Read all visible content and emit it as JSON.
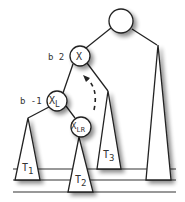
{
  "diagram": {
    "colors": {
      "stroke": "#222222",
      "fill": "#ffffff",
      "text": "#333333",
      "shadow": "#999999"
    },
    "nodes": [
      {
        "id": "root",
        "label": "",
        "cx": 121,
        "cy": 21,
        "r": 12
      },
      {
        "id": "x",
        "label": "X",
        "sub": "",
        "cx": 80,
        "cy": 56,
        "r": 10,
        "balance": "b 2"
      },
      {
        "id": "xl",
        "label": "X",
        "sub": "L",
        "cx": 57,
        "cy": 101,
        "r": 10,
        "balance": "b -1"
      },
      {
        "id": "xlr",
        "label": "X",
        "sub": "LR",
        "cx": 81,
        "cy": 127,
        "r": 10,
        "balance": ""
      }
    ],
    "subtrees": [
      {
        "id": "t1",
        "label": "T",
        "sub": "1"
      },
      {
        "id": "t2",
        "label": "T",
        "sub": "2"
      },
      {
        "id": "t3",
        "label": "T",
        "sub": "3"
      },
      {
        "id": "tr",
        "label": "",
        "sub": ""
      }
    ],
    "balance_labels": {
      "x": "b 2",
      "xl": "b -1"
    },
    "level_lines_y": [
      169,
      180,
      192
    ]
  }
}
